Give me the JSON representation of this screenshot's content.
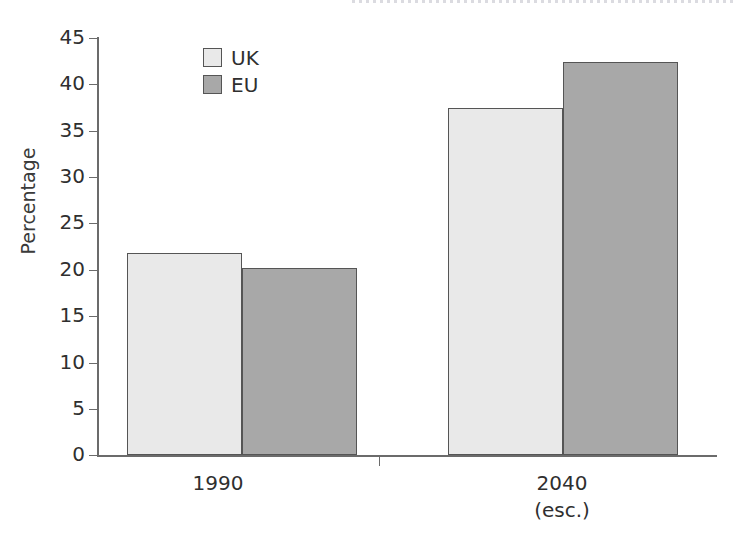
{
  "chart_data": {
    "type": "bar",
    "title": "",
    "subtitle": "",
    "xlabel": "",
    "ylabel": "Percentage",
    "categories": [
      "1990",
      "2040"
    ],
    "category_sublabels": [
      "",
      "(esc.)"
    ],
    "series": [
      {
        "name": "UK",
        "values": [
          21.8,
          37.5
        ],
        "color": "#e9e9e9"
      },
      {
        "name": "EU",
        "values": [
          20.2,
          42.4
        ],
        "color": "#a8a8a8"
      }
    ],
    "ylim": [
      0,
      45
    ],
    "ytick_step": 5,
    "yticks": [
      0,
      5,
      10,
      15,
      20,
      25,
      30,
      35,
      40,
      45
    ],
    "ytick_labels": [
      "0",
      "5",
      "10",
      "15",
      "20",
      "25",
      "30",
      "35",
      "40",
      "45"
    ],
    "grid": false,
    "legend_position": "top-left-inside",
    "bar_gap_within_group": 0,
    "axis_color": "#6b6b6b",
    "bar_border_color": "#555555",
    "text_color": "#2f2f2f"
  },
  "legend": {
    "items": [
      {
        "label": "UK",
        "swatch": "series-uk"
      },
      {
        "label": "EU",
        "swatch": "series-eu"
      }
    ]
  },
  "axes": {
    "y_title": "Percentage",
    "y_labels": [
      "45",
      "40",
      "35",
      "30",
      "25",
      "20",
      "15",
      "10",
      "5",
      "0"
    ],
    "x_labels": [
      {
        "main": "1990",
        "sub": ""
      },
      {
        "main": "2040",
        "sub": "(esc.)"
      }
    ]
  }
}
